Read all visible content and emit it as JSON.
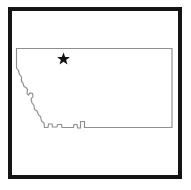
{
  "figure": {
    "type": "outline-map",
    "subject": "Montana",
    "background_color": "#ffffff",
    "width": 191,
    "height": 190
  },
  "frame": {
    "name": "border-frame",
    "color": "#141414",
    "thickness_px": 4,
    "x": 8,
    "y": 7,
    "width": 174,
    "height": 172
  },
  "state": {
    "name": "Montana",
    "outline_color": "#8e8e8e",
    "fill_color": "#ffffff",
    "outline_width_px": 1.15,
    "path": "M 16.5 48.5 L 172.0 48.5 L 172.0 127.5 L 84.5 127.5 L 84.5 121.5 L 80.5 121.5 L 80.5 128.0 L 77.5 128.0 L 77.0 124.5 L 74.0 124.5 L 73.5 127.5 L 62.0 127.5 L 61.5 124.5 L 57.5 124.5 L 57.0 127.0 L 52.5 127.0 L 52.0 124.0 L 48.5 124.0 L 48.0 127.5 L 44.5 127.5 L 44.0 123.0 L 41.5 121.0 L 40.5 116.5 L 38.5 115.0 L 37.0 111.0 L 34.5 109.5 L 34.0 105.5 L 32.0 103.0 L 31.0 99.0 L 33.0 96.5 L 32.5 93.5 L 30.0 93.0 L 28.5 95.0 L 27.0 93.5 L 27.5 89.5 L 26.0 87.5 L 24.0 86.5 L 23.0 83.0 L 21.5 81.5 L 21.5 77.0 L 19.5 74.5 L 18.5 70.5 L 16.5 68.0 Z"
  },
  "marker": {
    "name": "capital-star",
    "label": "Helena",
    "shape": "star",
    "color": "#111111",
    "x": 63.5,
    "y": 59.0,
    "size_px": 13
  },
  "labels": {
    "accessible_description": "Outline map of the state of Montana enclosed in a thick black rectangular frame, with a black star marking the state capital in the north-central region."
  }
}
